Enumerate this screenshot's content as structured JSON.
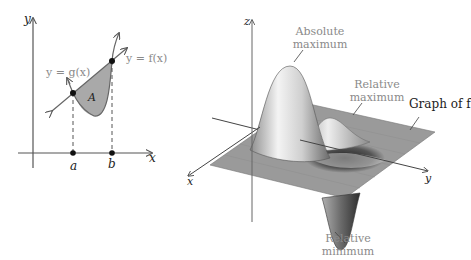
{
  "left_figure": {
    "axis_x_label": "x",
    "axis_y_label": "y",
    "curve_f_label": "y = f(x)",
    "curve_g_label": "y = g(x)",
    "region_label": "A",
    "point_a_label": "a",
    "point_b_label": "b",
    "colors": {
      "region_fill": "#a9a9a9",
      "axis": "#555555",
      "curve": "#666666"
    }
  },
  "right_figure": {
    "axis_x_label": "x",
    "axis_y_label": "y",
    "axis_z_label": "z",
    "annotations": {
      "absolute_max_line1": "Absolute",
      "absolute_max_line2": "maximum",
      "relative_max_line1": "Relative",
      "relative_max_line2": "maximum",
      "relative_min_line1": "Relative",
      "relative_min_line2": "minimum",
      "graph_label": "Graph of f"
    },
    "colors": {
      "plane": "#9a9a9a",
      "surface_light": "#f0f0f0",
      "surface_dark": "#4a4a4a"
    }
  }
}
